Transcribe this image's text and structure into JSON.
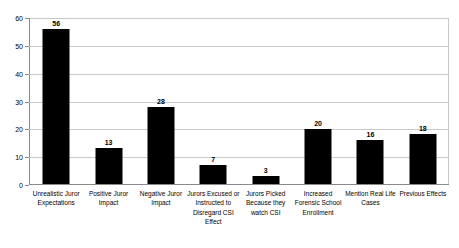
{
  "chart_data": {
    "type": "bar",
    "title": "",
    "subtitle": "",
    "xlabel": "",
    "ylabel": "",
    "ylim": [
      0,
      60
    ],
    "y_ticks": [
      0,
      10,
      20,
      30,
      40,
      50,
      60
    ],
    "grid": true,
    "legend": false,
    "legend_position": "none",
    "bar_color": "#000000",
    "gridline_color": "#C9C9C9",
    "axis_color": "#8A8A8A",
    "background": "#FFFFFF",
    "show_data_labels": true,
    "categories": [
      "Unrealistic Juror Expectations",
      "Positive Juror Impact",
      "Negative Juror Impact",
      "Jurors Excused or Instructed to Disregard CSI Effect",
      "Jurors Picked Because they watch CSI",
      "Increased Forensic School Enrollment",
      "Mention Real Life Cases",
      "Previous Effects"
    ],
    "values": [
      56,
      13,
      28,
      7,
      3,
      20,
      16,
      18
    ],
    "series": [
      {
        "name": "Count",
        "values": [
          56,
          13,
          28,
          7,
          3,
          20,
          16,
          18
        ]
      }
    ]
  }
}
